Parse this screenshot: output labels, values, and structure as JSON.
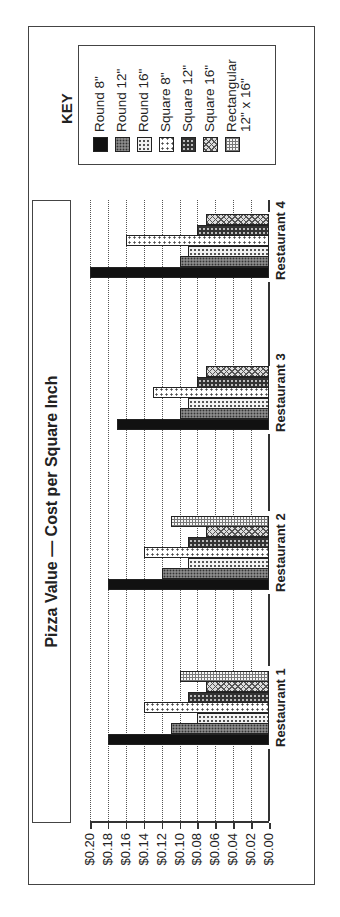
{
  "chart_data": {
    "type": "bar",
    "orientation": "rotated 90° counter-clockwise (vertical grouped bar chart printed sideways)",
    "title": "Pizza Value — Cost per Square Inch",
    "xlabel": "",
    "ylabel": "",
    "ylim": [
      0,
      0.2
    ],
    "y_ticks": [
      "$0.00",
      "$0.02",
      "$0.04",
      "$0.06",
      "$0.08",
      "$0.10",
      "$0.12",
      "$0.14",
      "$0.16",
      "$0.18",
      "$0.20"
    ],
    "grid": true,
    "legend_title": "KEY",
    "legend_position": "right",
    "categories": [
      "Restaurant 1",
      "Restaurant 2",
      "Restaurant 3",
      "Restaurant 4"
    ],
    "series": [
      {
        "name": "Round 8\"",
        "values": [
          0.18,
          0.18,
          0.17,
          0.2
        ]
      },
      {
        "name": "Round 12\"",
        "values": [
          0.11,
          0.12,
          0.1,
          0.1
        ]
      },
      {
        "name": "Round 16\"",
        "values": [
          0.08,
          0.09,
          0.09,
          0.09
        ]
      },
      {
        "name": "Square 8\"",
        "values": [
          0.14,
          0.14,
          0.13,
          0.16
        ]
      },
      {
        "name": "Square 12\"",
        "values": [
          0.09,
          0.09,
          0.08,
          0.08
        ]
      },
      {
        "name": "Square 16\"",
        "values": [
          0.07,
          0.07,
          0.07,
          0.07
        ]
      },
      {
        "name": "Rectangular 12\" x 16\"",
        "values": [
          0.1,
          0.11,
          null,
          null
        ]
      }
    ]
  },
  "title": "Pizza Value — Cost per Square Inch",
  "legend": {
    "title": "KEY",
    "items": [
      {
        "label": "Round 8\""
      },
      {
        "label": "Round 12\""
      },
      {
        "label": "Round 16\""
      },
      {
        "label": "Square 8\""
      },
      {
        "label": "Square 12\""
      },
      {
        "label": "Square 16\""
      },
      {
        "label": "Rectangular",
        "label2": "12\" x 16\""
      }
    ]
  },
  "axis": {
    "ticks": [
      "$0.00",
      "$0.02",
      "$0.04",
      "$0.06",
      "$0.08",
      "$0.10",
      "$0.12",
      "$0.14",
      "$0.16",
      "$0.18",
      "$0.20"
    ]
  },
  "categories": [
    "Restaurant 1",
    "Restaurant 2",
    "Restaurant 3",
    "Restaurant 4"
  ]
}
